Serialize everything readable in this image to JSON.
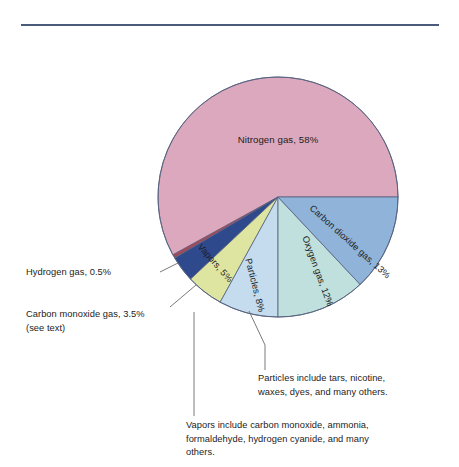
{
  "figure": {
    "title": "",
    "rule_color": "#4a5a7a"
  },
  "chart_data": {
    "type": "pie",
    "title": "",
    "xlabel": "",
    "ylabel": "",
    "unit": "percent",
    "total": 100,
    "start_angle_deg": 0,
    "direction": "counterclockwise",
    "legend": "none (labels drawn inside slices)",
    "categories": [
      "Nitrogen gas",
      "Hydrogen gas",
      "Carbon monoxide gas",
      "Vapors",
      "Particles",
      "Oxygen gas",
      "Carbon dioxide gas"
    ],
    "values": [
      58,
      0.5,
      3.5,
      5,
      8,
      12,
      13
    ],
    "slices": [
      {
        "name": "Nitrogen gas",
        "value": 58,
        "label": "Nitrogen gas, 58%",
        "color": "#dba8bd",
        "label_placement": "inside"
      },
      {
        "name": "Hydrogen gas",
        "value": 0.5,
        "label": "Hydrogen gas, 0.5%",
        "color": "#9e4b5e",
        "label_placement": "callout-left"
      },
      {
        "name": "Carbon monoxide gas",
        "value": 3.5,
        "label": "Carbon monoxide gas, 3.5%",
        "sublabel": "(see text)",
        "color": "#2e4a8c",
        "label_placement": "callout-left"
      },
      {
        "name": "Vapors",
        "value": 5,
        "label": "Vapors, 5%",
        "color": "#dde5a0",
        "label_placement": "inside"
      },
      {
        "name": "Particles",
        "value": 8,
        "label": "Particles, 8%",
        "color": "#c5dcef",
        "label_placement": "inside"
      },
      {
        "name": "Oxygen gas",
        "value": 12,
        "label": "Oxygen gas, 12%",
        "color": "#bfe0dd",
        "label_placement": "inside"
      },
      {
        "name": "Carbon dioxide gas",
        "value": 13,
        "label": "Carbon dioxide gas, 13%",
        "color": "#8fb3d9",
        "label_placement": "inside"
      }
    ],
    "annotations": [
      {
        "name": "hydrogen",
        "text": "Hydrogen gas, 0.5%"
      },
      {
        "name": "carbon-monoxide",
        "text": "Carbon monoxide gas, 3.5%\n(see text)"
      },
      {
        "name": "particles",
        "text": "Particles include tars, nicotine,\nwaxes, dyes, and many others."
      },
      {
        "name": "vapors",
        "text": "Vapors include carbon monoxide, ammonia,\nformaldehyde, hydrogen cyanide, and many\nothers."
      }
    ]
  },
  "labels": {
    "nitrogen": "Nitrogen gas, 58%",
    "carbon_dioxide": "Carbon dioxide gas, 13%",
    "oxygen": "Oxygen gas, 12%",
    "particles": "Particles, 8%",
    "vapors": "Vapors, 5%"
  },
  "callouts": {
    "hydrogen": "Hydrogen gas, 0.5%",
    "carbon_monoxide": "Carbon monoxide gas, 3.5%\n(see text)",
    "particles_note": "Particles include tars, nicotine,\nwaxes, dyes, and many others.",
    "vapors_note": "Vapors include carbon monoxide, ammonia,\nformaldehyde, hydrogen cyanide, and many\nothers."
  }
}
